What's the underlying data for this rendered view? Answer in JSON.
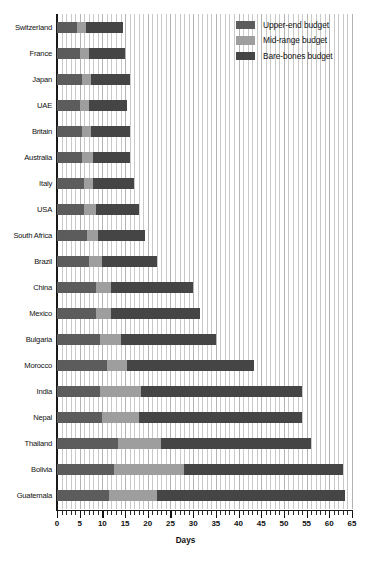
{
  "chart_data": {
    "type": "bar",
    "orientation": "horizontal",
    "stacked": true,
    "title": "",
    "xlabel": "Days",
    "ylabel": "",
    "xlim": [
      0,
      65
    ],
    "xticks": [
      0,
      5,
      10,
      15,
      20,
      25,
      30,
      35,
      40,
      45,
      50,
      55,
      60,
      65
    ],
    "xtick_labels": [
      "0",
      "5",
      "10",
      "15",
      "20",
      "25",
      "30",
      "35",
      "40",
      "45",
      "50",
      "55",
      "60",
      "65"
    ],
    "minor_tick_step": 1,
    "grid": true,
    "grid_axis": "x",
    "legend_position": "top-right",
    "categories": [
      "Switzerland",
      "France",
      "Japan",
      "UAE",
      "Britain",
      "Australia",
      "Italy",
      "USA",
      "South Africa",
      "Brazil",
      "China",
      "Mexico",
      "Bulgaria",
      "Morocco",
      "India",
      "Nepal",
      "Thailand",
      "Bolivia",
      "Guatemala"
    ],
    "series": [
      {
        "name": "Upper-end budget",
        "color": "#5c5c5c",
        "values": [
          4.5,
          5.0,
          5.5,
          5.0,
          5.5,
          5.5,
          6.0,
          6.0,
          6.5,
          7.0,
          8.5,
          8.5,
          9.5,
          11.0,
          9.5,
          10.0,
          13.5,
          12.5,
          11.5
        ]
      },
      {
        "name": "Mid-range budget",
        "color": "#9e9e9e",
        "values": [
          2.0,
          2.0,
          2.0,
          2.0,
          2.0,
          2.5,
          2.0,
          2.5,
          2.5,
          3.0,
          3.5,
          3.5,
          4.5,
          4.5,
          9.0,
          8.0,
          9.5,
          15.5,
          10.5
        ]
      },
      {
        "name": "Bare-bones budget",
        "color": "#454545",
        "values": [
          8.0,
          8.0,
          8.5,
          8.5,
          8.5,
          8.0,
          9.0,
          9.5,
          10.5,
          12.0,
          18.0,
          19.5,
          21.0,
          28.0,
          35.5,
          36.0,
          33.0,
          35.0,
          41.5
        ]
      }
    ],
    "totals": [
      14.5,
      15.0,
      16.0,
      15.5,
      16.0,
      16.0,
      17.0,
      18.0,
      19.5,
      22.0,
      30.0,
      31.5,
      35.0,
      43.5,
      54.0,
      54.0,
      56.0,
      63.0,
      63.5
    ]
  },
  "legend": {
    "items": [
      {
        "label": "Upper-end budget",
        "color": "#5c5c5c"
      },
      {
        "label": "Mid-range budget",
        "color": "#9e9e9e"
      },
      {
        "label": "Bare-bones budget",
        "color": "#454545"
      }
    ]
  }
}
